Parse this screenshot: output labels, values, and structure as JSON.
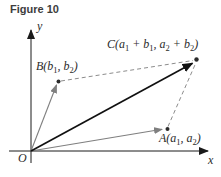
{
  "figure": {
    "title": "Figure 10",
    "axes": {
      "x_label": "x",
      "y_label": "y",
      "origin_label": "O"
    },
    "points": {
      "A": {
        "parts": [
          "A(a",
          "1",
          ", a",
          "2",
          ")"
        ]
      },
      "B": {
        "parts": [
          "B(b",
          "1",
          ", b",
          "2",
          ")"
        ]
      },
      "C": {
        "parts": [
          "C(a",
          "1",
          " + b",
          "1",
          ", a",
          "2",
          " + b",
          "2",
          ")"
        ]
      }
    },
    "colors": {
      "title": "#3d3d3d",
      "axis": "#1a1a1a",
      "vector_sum": "#111111",
      "vector_component": "#7f7f7f",
      "dashed": "#8c8c8c",
      "point": "#2b2b2b",
      "background": "#ffffff"
    }
  }
}
